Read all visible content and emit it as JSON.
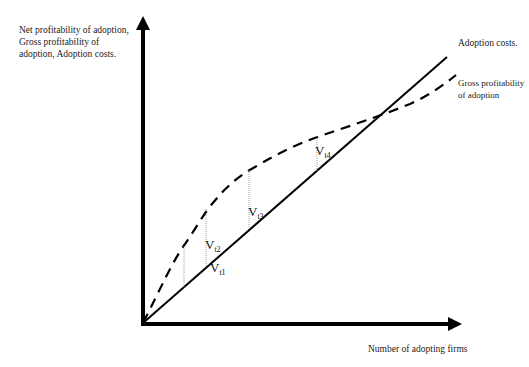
{
  "axes": {
    "y_label": "Net profitability of adoption, Gross profitability of adoption, Adoption costs.",
    "x_label": "Number of adopting firms"
  },
  "curves": {
    "adoption_costs": {
      "label": "Adoption costs.",
      "style": "solid",
      "color": "#000000"
    },
    "gross_profitability": {
      "label": "Gross profitability of adoption",
      "style": "dashed",
      "color": "#000000"
    }
  },
  "gaps": [
    {
      "symbol": "V",
      "subscript": "t1"
    },
    {
      "symbol": "V",
      "subscript": "t2"
    },
    {
      "symbol": "V",
      "subscript": "t3"
    },
    {
      "symbol": "V",
      "subscript": "t4"
    }
  ]
}
